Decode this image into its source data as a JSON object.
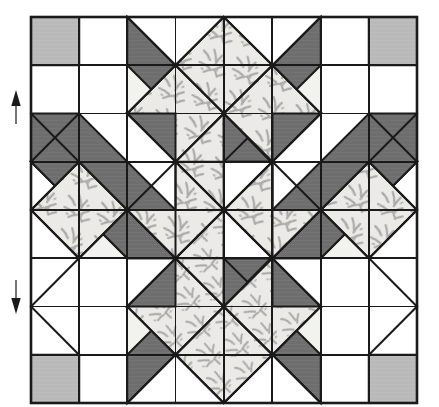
{
  "figure": {
    "type": "quilt-block-diagram",
    "canvas": {
      "width": 439,
      "height": 407
    },
    "grid": {
      "columns": 8,
      "rows": 8,
      "cell_size": 48.25,
      "origin_x": 31,
      "origin_y": 17,
      "center_x": 224,
      "center_y": 210
    }
  },
  "colors": {
    "background": "#ffffff",
    "outline": "#1a1a1a",
    "white_fabric": "#ffffff",
    "offwhite_fabric": "#f2f2ef",
    "dark_gray_fabric": "#6e6e6e",
    "light_gray_fabric": "#b9b9b9",
    "print_fabric_base": "#eceae6",
    "print_fabric_motif": "#a8a8a8"
  },
  "legend": {
    "fabrics": [
      {
        "key": "white_fabric",
        "label": "Background white"
      },
      {
        "key": "offwhite_fabric",
        "label": "Off-white background"
      },
      {
        "key": "dark_gray_fabric",
        "label": "Dark solid"
      },
      {
        "key": "light_gray_fabric",
        "label": "Medium solid (corner squares)"
      },
      {
        "key": "print_fabric_base",
        "label": "Light floral print"
      }
    ]
  },
  "markers": {
    "grainline_arrows": [
      {
        "name": "grainline-arrow-up",
        "direction": "up",
        "x": 16,
        "y_top": 92,
        "y_bottom": 124
      },
      {
        "name": "grainline-arrow-down",
        "direction": "down",
        "x": 16,
        "y_top": 280,
        "y_bottom": 312
      }
    ]
  },
  "chart_data": {
    "type": "diagram",
    "grid_units": 8,
    "star_points": 8,
    "corner_squares": [
      {
        "position": "top-left",
        "col": 0,
        "row": 0,
        "fabric": "light_gray_fabric"
      },
      {
        "position": "top-right",
        "col": 7,
        "row": 0,
        "fabric": "light_gray_fabric"
      },
      {
        "position": "bottom-left",
        "col": 0,
        "row": 7,
        "fabric": "light_gray_fabric"
      },
      {
        "position": "bottom-right",
        "col": 7,
        "row": 7,
        "fabric": "light_gray_fabric"
      }
    ],
    "band_count": 4,
    "band_fabrics": [
      "dark_gray_fabric",
      "print_fabric_base"
    ]
  }
}
